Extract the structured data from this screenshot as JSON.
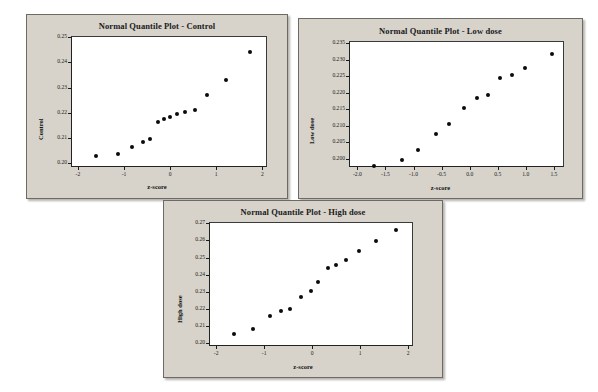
{
  "page": {
    "background_color": "#ffffff",
    "panel_background_color": "#d7d3ca",
    "plot_area_color": "#ffffff",
    "marker_color": "#0b0b0b",
    "axis_color": "#1b1b1b"
  },
  "charts": [
    {
      "id": "control",
      "chart_data": {
        "type": "scatter",
        "title": "Normal Quantile Plot - Control",
        "xlabel": "z-score",
        "ylabel": "Control",
        "xlim": [
          -2.15,
          2.1
        ],
        "ylim": [
          0.1985,
          0.2505
        ],
        "grid": false,
        "legend": "none",
        "xticks": [
          -2,
          -1,
          0,
          1,
          2
        ],
        "xticklabels": [
          "-2",
          "-1",
          "0",
          "1",
          "2"
        ],
        "yticks": [
          0.2,
          0.21,
          0.22,
          0.23,
          0.24,
          0.25
        ],
        "yticklabels": [
          "0.20",
          "0.21",
          "0.22",
          "0.23",
          "0.24",
          "0.25"
        ],
        "x": [
          -1.64,
          -1.15,
          -0.85,
          -0.62,
          -0.45,
          -0.28,
          -0.15,
          -0.02,
          0.12,
          0.3,
          0.52,
          0.78,
          1.18,
          1.7
        ],
        "y": [
          0.2033,
          0.2041,
          0.2069,
          0.2089,
          0.2099,
          0.2168,
          0.2178,
          0.2188,
          0.2198,
          0.2206,
          0.2217,
          0.2273,
          0.2334,
          0.2444
        ],
        "n_points": 14
      }
    },
    {
      "id": "low-dose",
      "chart_data": {
        "type": "scatter",
        "title": "Normal Quantile Plot - Low dose",
        "xlabel": "z-score",
        "ylabel": "Low dose",
        "xlim": [
          -2.15,
          1.68
        ],
        "ylim": [
          0.1975,
          0.2357
        ],
        "grid": false,
        "legend": "none",
        "xticks": [
          -2.0,
          -1.5,
          -1.0,
          -0.5,
          0.0,
          0.5,
          1.0,
          1.5
        ],
        "xticklabels": [
          "-2.0",
          "-1.5",
          "-1.0",
          "-0.5",
          "0.0",
          "0.5",
          "1.0",
          "1.5"
        ],
        "yticks": [
          0.2,
          0.205,
          0.21,
          0.215,
          0.22,
          0.225,
          0.23,
          0.235
        ],
        "yticklabels": [
          "0.200",
          "0.205",
          "0.210",
          "0.215",
          "0.220",
          "0.225",
          "0.230",
          "0.235"
        ],
        "x": [
          -1.72,
          -1.23,
          -0.93,
          -0.62,
          -0.38,
          -0.12,
          0.12,
          0.3,
          0.52,
          0.73,
          0.96,
          1.44
        ],
        "y": [
          0.1982,
          0.2,
          0.2029,
          0.2078,
          0.2107,
          0.2157,
          0.2188,
          0.2197,
          0.2249,
          0.2256,
          0.2277,
          0.2322
        ],
        "n_points": 12
      }
    },
    {
      "id": "high-dose",
      "chart_data": {
        "type": "scatter",
        "title": "Normal Quantile Plot - High dose",
        "xlabel": "z-score",
        "ylabel": "High dose",
        "xlim": [
          -2.15,
          2.1
        ],
        "ylim": [
          0.1985,
          0.2707
        ],
        "grid": false,
        "legend": "none",
        "xticks": [
          -2,
          -1,
          0,
          1,
          2
        ],
        "xticklabels": [
          "-2",
          "-1",
          "0",
          "1",
          "2"
        ],
        "yticks": [
          0.2,
          0.21,
          0.22,
          0.23,
          0.24,
          0.25,
          0.26,
          0.27
        ],
        "yticklabels": [
          "0.20",
          "0.21",
          "0.22",
          "0.23",
          "0.24",
          "0.25",
          "0.26",
          "0.27"
        ],
        "x": [
          -1.64,
          -1.25,
          -0.9,
          -0.68,
          -0.48,
          -0.26,
          -0.05,
          0.1,
          0.3,
          0.48,
          0.68,
          0.95,
          1.3,
          1.72
        ],
        "y": [
          0.2062,
          0.2089,
          0.2167,
          0.2194,
          0.2208,
          0.2277,
          0.2312,
          0.2366,
          0.2443,
          0.2464,
          0.2493,
          0.2543,
          0.2602,
          0.2664
        ],
        "n_points": 14
      }
    }
  ]
}
